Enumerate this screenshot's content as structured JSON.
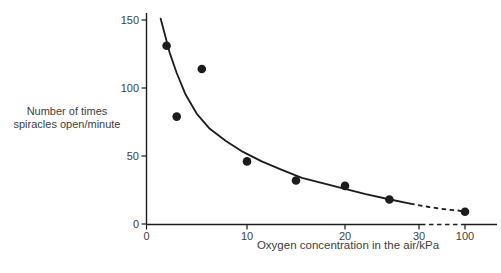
{
  "figure": {
    "background": "#ffffff",
    "ink_color": "#1c1c1c",
    "text_color": "#3e3e3e"
  },
  "chart_data": {
    "type": "scatter",
    "title": "",
    "xlabel": "Oxygen concentration in the air/kPa",
    "ylabel": "Number of times spiracles open/minute",
    "ylabel_lines": [
      "Number of times",
      "spiracles open/minute"
    ],
    "x_ticks": [
      0,
      10,
      20,
      30,
      100
    ],
    "y_ticks": [
      0,
      50,
      100,
      150
    ],
    "ylim": [
      0,
      150
    ],
    "grid": false,
    "legend": null,
    "axis_break": {
      "x_between": [
        30,
        100
      ],
      "rendering": "dashed-axis-and-dashed-curve"
    },
    "points": [
      {
        "x": 2,
        "y": 131
      },
      {
        "x": 3,
        "y": 79
      },
      {
        "x": 5.5,
        "y": 114
      },
      {
        "x": 10,
        "y": 46
      },
      {
        "x": 15,
        "y": 32
      },
      {
        "x": 20,
        "y": 28
      },
      {
        "x": 26,
        "y": 18
      },
      {
        "x": 100,
        "y": 9
      }
    ],
    "fit_curve_solid": [
      [
        1.4,
        151
      ],
      [
        1.8,
        140
      ],
      [
        2.3,
        126
      ],
      [
        3.0,
        111
      ],
      [
        3.9,
        95
      ],
      [
        5.0,
        81
      ],
      [
        6.3,
        70
      ],
      [
        7.9,
        61
      ],
      [
        9.6,
        53
      ],
      [
        11.5,
        46
      ],
      [
        13.5,
        40
      ],
      [
        15.6,
        34
      ],
      [
        17.7,
        30
      ],
      [
        19.9,
        26
      ],
      [
        22.8,
        22
      ],
      [
        26.1,
        18
      ],
      [
        28.8,
        15
      ]
    ],
    "fit_curve_dashed": [
      [
        28.8,
        15
      ],
      [
        33,
        13.5
      ],
      [
        45,
        12.5
      ],
      [
        60,
        11.5
      ],
      [
        75,
        10.5
      ],
      [
        88,
        10
      ],
      [
        97.5,
        9.2
      ]
    ]
  }
}
